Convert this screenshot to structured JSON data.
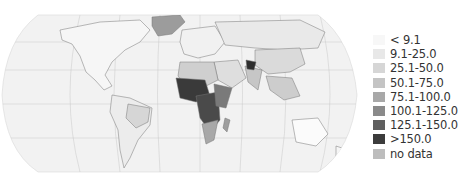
{
  "map": {
    "projection": "Robinson-style world map",
    "theme": "choropleth, grayscale"
  },
  "legend": {
    "items": [
      {
        "label": "< 9.1",
        "color": "#f7f7f7"
      },
      {
        "label": "9.1-25.0",
        "color": "#e8e8e8"
      },
      {
        "label": "25.1-50.0",
        "color": "#d6d6d6"
      },
      {
        "label": "50.1-75.0",
        "color": "#c4c4c4"
      },
      {
        "label": "75.1-100.0",
        "color": "#a8a8a8"
      },
      {
        "label": "100.1-125.0",
        "color": "#8a8a8a"
      },
      {
        "label": "125.1-150.0",
        "color": "#5f5f5f"
      },
      {
        "label": ">150.0",
        "color": "#3c3c3c"
      },
      {
        "label": "no data",
        "color": "#bdbdbd"
      }
    ]
  }
}
